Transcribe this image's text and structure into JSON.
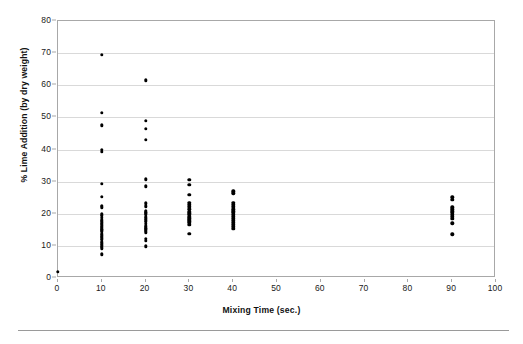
{
  "chart_data": {
    "type": "scatter",
    "title": "",
    "xlabel": "Mixing Time (sec.)",
    "ylabel": "% Lime Addition (by dry weight)",
    "xlim": [
      0,
      100
    ],
    "ylim": [
      0,
      80
    ],
    "xticks": [
      0,
      10,
      20,
      30,
      40,
      50,
      60,
      70,
      80,
      90,
      100
    ],
    "yticks": [
      0,
      10,
      20,
      30,
      40,
      50,
      60,
      70,
      80
    ],
    "grid": "horizontal",
    "legend": "none",
    "marker_color": "#000000",
    "plot_background": "#ffffff",
    "gridline_color": "#d9d9d9",
    "frame_color": "#a8a8a8",
    "series": [
      {
        "name": "Lime addition samples",
        "points": [
          [
            0,
            2.0
          ],
          [
            10,
            69.5
          ],
          [
            10,
            51.5
          ],
          [
            10,
            47.5
          ],
          [
            10,
            40.0
          ],
          [
            10,
            39.3
          ],
          [
            10,
            29.3
          ],
          [
            10,
            25.2
          ],
          [
            10,
            22.5
          ],
          [
            10,
            22.0
          ],
          [
            10,
            19.8
          ],
          [
            10,
            19.3
          ],
          [
            10,
            18.8
          ],
          [
            10,
            18.2
          ],
          [
            10,
            17.8
          ],
          [
            10,
            17.3
          ],
          [
            10,
            16.9
          ],
          [
            10,
            16.4
          ],
          [
            10,
            16.0
          ],
          [
            10,
            15.6
          ],
          [
            10,
            15.2
          ],
          [
            10,
            14.8
          ],
          [
            10,
            14.3
          ],
          [
            10,
            13.8
          ],
          [
            10,
            13.3
          ],
          [
            10,
            12.8
          ],
          [
            10,
            12.3
          ],
          [
            10,
            11.8
          ],
          [
            10,
            11.3
          ],
          [
            10,
            10.8
          ],
          [
            10,
            10.2
          ],
          [
            10,
            9.7
          ],
          [
            10,
            9.2
          ],
          [
            10,
            7.4
          ],
          [
            20,
            61.5
          ],
          [
            20,
            48.9
          ],
          [
            20,
            46.4
          ],
          [
            20,
            43.1
          ],
          [
            20,
            30.7
          ],
          [
            20,
            28.5
          ],
          [
            20,
            23.2
          ],
          [
            20,
            22.3
          ],
          [
            20,
            21.0
          ],
          [
            20,
            20.5
          ],
          [
            20,
            20.1
          ],
          [
            20,
            19.6
          ],
          [
            20,
            19.1
          ],
          [
            20,
            18.6
          ],
          [
            20,
            18.0
          ],
          [
            20,
            17.4
          ],
          [
            20,
            16.8
          ],
          [
            20,
            16.3
          ],
          [
            20,
            15.9
          ],
          [
            20,
            15.5
          ],
          [
            20,
            15.1
          ],
          [
            20,
            14.7
          ],
          [
            20,
            14.2
          ],
          [
            20,
            12.2
          ],
          [
            20,
            11.6
          ],
          [
            20,
            9.9
          ],
          [
            30,
            30.5
          ],
          [
            30,
            29.1
          ],
          [
            30,
            25.9
          ],
          [
            30,
            23.4
          ],
          [
            30,
            22.7
          ],
          [
            30,
            22.1
          ],
          [
            30,
            21.4
          ],
          [
            30,
            20.7
          ],
          [
            30,
            20.1
          ],
          [
            30,
            19.6
          ],
          [
            30,
            19.1
          ],
          [
            30,
            18.6
          ],
          [
            30,
            18.1
          ],
          [
            30,
            17.6
          ],
          [
            30,
            17.1
          ],
          [
            30,
            16.6
          ],
          [
            30,
            13.8
          ],
          [
            40,
            27.0
          ],
          [
            40,
            26.4
          ],
          [
            40,
            23.5
          ],
          [
            40,
            22.8
          ],
          [
            40,
            22.1
          ],
          [
            40,
            21.4
          ],
          [
            40,
            20.8
          ],
          [
            40,
            20.2
          ],
          [
            40,
            19.6
          ],
          [
            40,
            19.0
          ],
          [
            40,
            18.4
          ],
          [
            40,
            17.8
          ],
          [
            40,
            17.2
          ],
          [
            40,
            16.6
          ],
          [
            40,
            16.0
          ],
          [
            40,
            15.4
          ],
          [
            90,
            25.1
          ],
          [
            90,
            24.4
          ],
          [
            90,
            22.0
          ],
          [
            90,
            21.4
          ],
          [
            90,
            20.8
          ],
          [
            90,
            20.2
          ],
          [
            90,
            19.6
          ],
          [
            90,
            19.0
          ],
          [
            90,
            18.4
          ],
          [
            90,
            17.0
          ],
          [
            90,
            13.6
          ]
        ]
      }
    ]
  }
}
